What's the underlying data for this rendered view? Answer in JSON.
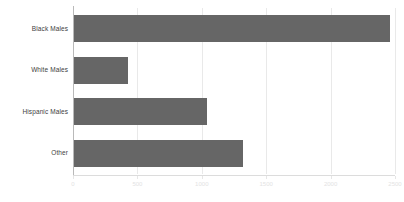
{
  "chart_data": {
    "type": "bar",
    "orientation": "horizontal",
    "title": "",
    "subtitle": "",
    "xlabel": "",
    "ylabel": "",
    "categories": [
      "Black Males",
      "White Males",
      "Hispanic Males",
      "Other"
    ],
    "values": [
      2460,
      430,
      1040,
      1320
    ],
    "series": [
      {
        "name": "",
        "values": [
          2460,
          430,
          1040,
          1320
        ]
      }
    ],
    "xlim": [
      0,
      2500
    ],
    "xticks": [
      0,
      500,
      1000,
      1500,
      2000,
      2500
    ],
    "xtick_labels": [
      "0",
      "500",
      "1000",
      "1500",
      "2000",
      "2500"
    ],
    "grid": true,
    "grid_axis": "x",
    "legend": false,
    "legend_position": "none",
    "annotations": []
  },
  "style": {
    "bar_color": "#666666",
    "grid_color": "#e9e9e9",
    "axis_color": "#b9b9b9",
    "tick_label_color": "#e3e3e3",
    "category_label_color": "#404040",
    "background": "#ffffff"
  }
}
